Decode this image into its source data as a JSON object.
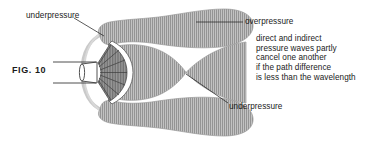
{
  "figure": {
    "caption": "FIG.  10"
  },
  "labels": {
    "underpressure_top": "underpressure",
    "overpressure": "overpressure",
    "underpressure_bottom": "underpressure"
  },
  "note": {
    "lines": [
      "direct and indirect",
      "pressure waves partly",
      "cancel one another",
      "if the path difference",
      "is less than the wavelength"
    ],
    "line_1": "direct and indirect",
    "line_2": "pressure waves partly",
    "line_3": "cancel one another",
    "line_4": "if the path difference",
    "line_5": "is less than the wavelength"
  },
  "parts": {
    "speaker_cone": "speaker-cone",
    "voice_coil": "voice-coil-magnet",
    "baffle": "white-baffle-arc",
    "enclosure_arc": "rear-wave-arc",
    "terminal_upper": "upper-terminal-wire",
    "terminal_lower": "lower-terminal-wire",
    "lobe_upper_front": "upper-front-overpressure-lobe",
    "lobe_lower_front": "lower-front-overpressure-lobe",
    "lobe_upper_rear": "upper-rear-underpressure-lobe",
    "lobe_lower_rear": "lower-rear-underpressure-lobe",
    "hourglass": "central-hourglass-overpressure-region",
    "pinch_point": "cancellation-pinch-point"
  },
  "colors": {
    "background": "#ffffff",
    "hatch_fill": "#a9a9a9",
    "hatch_line": "#8e8e8e",
    "outline": "#5e5e5e",
    "cone_fill": "#7f7f7f",
    "cone_segment_line": "#3a3a3a",
    "leader_line": "#2b2b2b",
    "text": "#1a1a1a",
    "rear_arc": "#c8c8c8"
  }
}
